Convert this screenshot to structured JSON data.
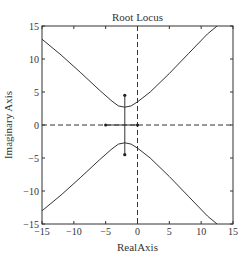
{
  "chart_data": {
    "type": "line",
    "title": "Root Locus",
    "xlabel": "RealAxis",
    "ylabel": "Imaginary Axis",
    "xlim": [
      -15,
      15
    ],
    "ylim": [
      -15,
      15
    ],
    "xticks": [
      -15,
      -10,
      -5,
      0,
      5,
      10,
      15
    ],
    "yticks": [
      -15,
      -10,
      -5,
      0,
      5,
      10,
      15
    ],
    "grid": false,
    "legend": null,
    "series": [
      {
        "name": "upper-branch",
        "style": "solid",
        "points": [
          [
            -15,
            13.0
          ],
          [
            -12,
            10.6
          ],
          [
            -9,
            8.0
          ],
          [
            -6,
            5.3
          ],
          [
            -4,
            3.6
          ],
          [
            -3,
            2.9
          ],
          [
            -2,
            2.7
          ],
          [
            -1,
            2.9
          ],
          [
            0,
            3.5
          ],
          [
            2,
            5.0
          ],
          [
            5,
            7.8
          ],
          [
            8,
            10.8
          ],
          [
            11,
            13.8
          ],
          [
            12.5,
            15
          ]
        ]
      },
      {
        "name": "lower-branch",
        "style": "solid",
        "points": [
          [
            -15,
            -13.0
          ],
          [
            -12,
            -10.6
          ],
          [
            -9,
            -8.0
          ],
          [
            -6,
            -5.3
          ],
          [
            -4,
            -3.6
          ],
          [
            -3,
            -2.9
          ],
          [
            -2,
            -2.7
          ],
          [
            -1,
            -2.9
          ],
          [
            0,
            -3.5
          ],
          [
            2,
            -5.0
          ],
          [
            5,
            -7.8
          ],
          [
            8,
            -10.8
          ],
          [
            11,
            -13.8
          ],
          [
            12.5,
            -15
          ]
        ]
      },
      {
        "name": "vertical-branch",
        "style": "solid",
        "points": [
          [
            -2,
            4.5
          ],
          [
            -2,
            -4.5
          ]
        ]
      },
      {
        "name": "real-axis-segment",
        "style": "solid",
        "points": [
          [
            -5,
            0
          ],
          [
            0,
            0
          ]
        ]
      }
    ],
    "reference_lines": [
      {
        "orientation": "horizontal",
        "value": 0,
        "style": "dashed"
      },
      {
        "orientation": "vertical",
        "value": 0,
        "style": "dashed"
      }
    ],
    "markers": [
      {
        "x": -5,
        "y": 0,
        "shape": "dot"
      },
      {
        "x": 0,
        "y": 0,
        "shape": "dot"
      },
      {
        "x": -2,
        "y": 4.5,
        "shape": "dot"
      },
      {
        "x": -2,
        "y": -4.5,
        "shape": "dot"
      }
    ]
  }
}
